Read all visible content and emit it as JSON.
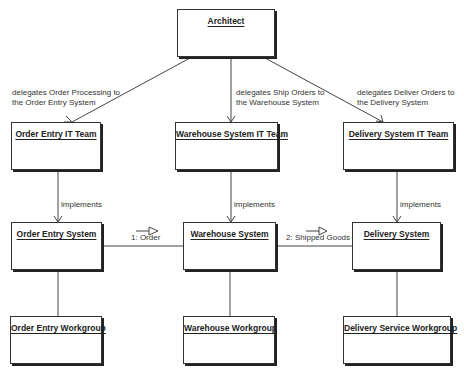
{
  "nodes": {
    "architect": "Architect",
    "order_entry_it_team": "Order Entry IT Team",
    "warehouse_system_it_team": "Warehouse System IT Team",
    "delivery_system_it_team": "Delivery System IT Team",
    "order_entry_system": "Order Entry System",
    "warehouse_system": "Warehouse System",
    "delivery_system": "Delivery System",
    "order_entry_workgroup": "Order Entry Workgroup",
    "warehouse_workgroup": "Warehouse Workgroup",
    "delivery_service_workgroup": "Delivery Service Workgroup"
  },
  "edges": {
    "delegates_order": [
      "delegates Order Processing to",
      "the Order Entry System"
    ],
    "delegates_ship": [
      "delegates Ship Orders to",
      "the Warehouse System"
    ],
    "delegates_deliver": [
      "delegates Deliver Orders to",
      "the Delivery System"
    ],
    "implements_1": "implements",
    "implements_2": "implements",
    "implements_3": "implements",
    "message_1": "1: Order",
    "message_2": "2: Shipped Goods"
  }
}
